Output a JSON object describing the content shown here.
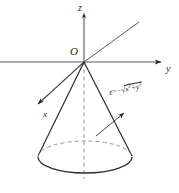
{
  "figure": {
    "name": "downward-opening-cone-in-3d-axes",
    "background_color": "#ffffff",
    "line_color": "#2b2b2b",
    "labels": {
      "z_axis": "z",
      "y_axis": "y",
      "x_axis": "x",
      "origin": "O"
    },
    "equation": {
      "lhs": "z",
      "equals": "=",
      "minus": "−",
      "radical": "√",
      "radicand_first": "x",
      "radicand_exp_first": "2",
      "plus": "+",
      "radicand_second": "y",
      "radicand_exp_second": "2",
      "full_text": "z = −√(x²+y²)"
    }
  },
  "geometry": {
    "origin": {
      "x": 84,
      "y": 62
    },
    "base_ellipse": {
      "cx": 85,
      "cy": 157,
      "rx": 47,
      "ry": 16
    },
    "z_axis": {
      "x1": 84,
      "y1": 14,
      "x2": 84,
      "y2": 62
    },
    "y_axis": {
      "x1": 0,
      "y1": 62,
      "x2": 163,
      "y2": 62
    },
    "x_axis_arrow_tip": {
      "x": 35,
      "y": 106
    },
    "x_axis_far": {
      "x": 140,
      "y": 22
    },
    "dashed_axis_bottom": {
      "x": 84,
      "y": 179
    },
    "pointer_arrow": {
      "x1": 100,
      "y1": 130,
      "x2": 126,
      "y2": 112
    }
  }
}
